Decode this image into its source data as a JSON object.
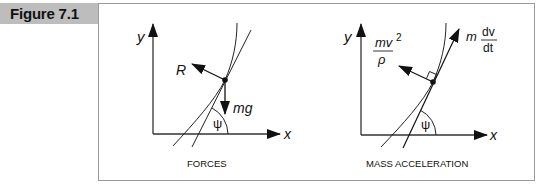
{
  "figure": {
    "label": "Figure 7.1",
    "tab_color": "#bdbdbd",
    "frame_color": "#9a9a9a"
  },
  "diagrams": [
    {
      "caption": "FORCES",
      "axis_x": "x",
      "axis_y": "y",
      "angle": "ψ",
      "vectors": [
        {
          "label": "R",
          "direction": "normal"
        },
        {
          "label": "mg",
          "direction": "down"
        }
      ]
    },
    {
      "caption": "MASS ACCELERATION",
      "axis_x": "x",
      "axis_y": "y",
      "angle": "ψ",
      "vectors": [
        {
          "label_num": "mv",
          "label_exp": "2",
          "label_den": "ρ",
          "direction": "normal"
        },
        {
          "label_coef": "m",
          "label_num": "dv",
          "label_den": "dt",
          "direction": "tangent"
        }
      ],
      "right_angle_marker": true
    }
  ]
}
